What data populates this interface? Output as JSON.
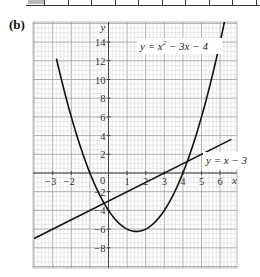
{
  "part_label": "(b)",
  "chart_data": {
    "type": "line",
    "title": "",
    "xlabel": "x",
    "ylabel": "y",
    "xlim": [
      -4,
      6.6
    ],
    "ylim": [
      -10,
      16
    ],
    "grid": true,
    "x_ticks": [
      -3,
      -2,
      -1,
      0,
      1,
      2,
      3,
      4,
      5,
      6
    ],
    "x_tick_labels": [
      "−3",
      "−2",
      "−1",
      "0",
      "1",
      "2",
      "3",
      "4",
      "5",
      "6"
    ],
    "y_ticks": [
      14,
      12,
      10,
      8,
      6,
      4,
      2,
      -2,
      -4,
      -6,
      -8
    ],
    "y_tick_labels": [
      "14",
      "12",
      "10",
      "8",
      "6",
      "4",
      "2",
      "−2",
      "−4",
      "−6",
      "−8"
    ],
    "series": [
      {
        "name": "y = x² − 3x − 4",
        "label": "y = x² − 3x − 4",
        "kind": "curve",
        "x": [
          -2.6,
          -2,
          -1,
          0,
          1,
          1.5,
          2,
          3,
          4,
          5,
          6.2
        ],
        "y": [
          10.56,
          6,
          0,
          -4,
          -6,
          -6.25,
          -6,
          -4,
          0,
          6,
          15.84
        ]
      },
      {
        "name": "y = x − 3",
        "label": "y = x − 3",
        "kind": "line",
        "x": [
          -4,
          6.6
        ],
        "y": [
          -7,
          3.6
        ]
      }
    ],
    "intersections": [
      {
        "x": -0.41,
        "y": -3.41
      },
      {
        "x": 4.41,
        "y": 1.41
      }
    ]
  }
}
